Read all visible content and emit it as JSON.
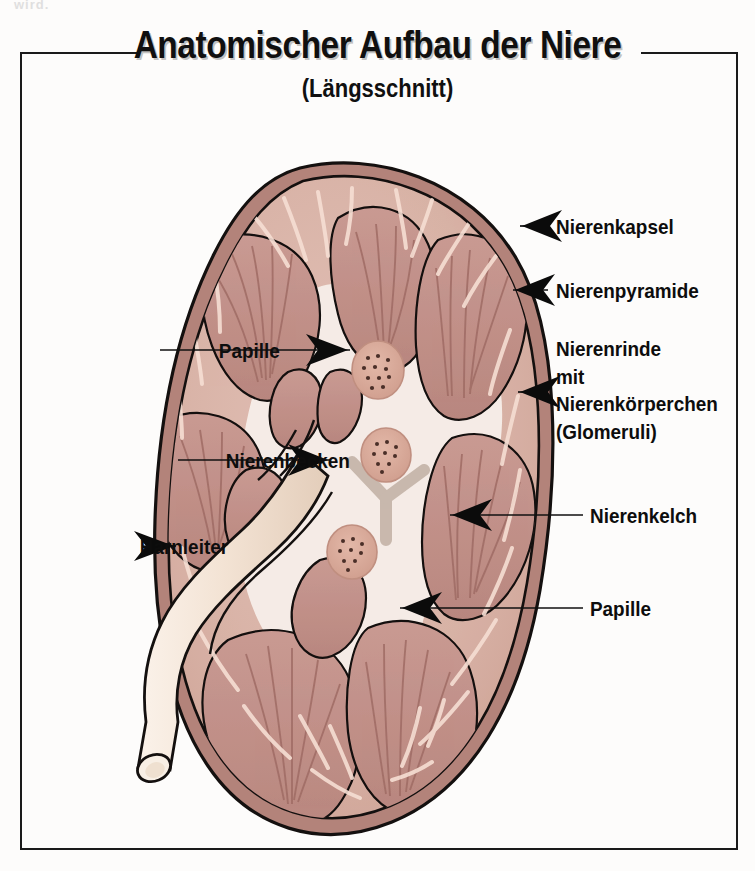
{
  "figure": {
    "title": "Anatomischer Aufbau der Niere",
    "subtitle": "(Längsschnitt)",
    "scan_fragment": "wird.",
    "organ": "Niere (Kidney), longitudinal section"
  },
  "labels": {
    "left": [
      {
        "id": "papille-top",
        "text": "Papille",
        "leader": "line"
      },
      {
        "id": "nierenbecken",
        "text": "Nierenbecken",
        "leader": "line-arrow"
      },
      {
        "id": "harnleiter",
        "text": "Harnleiter",
        "leader": "arrow"
      }
    ],
    "right": [
      {
        "id": "nierenkapsel",
        "text": "Nierenkapsel",
        "leader": "line-arrow"
      },
      {
        "id": "nierenpyramide",
        "text": "Nierenpyramide",
        "leader": "line-arrow"
      },
      {
        "id": "nierenrinde",
        "text": "Nierenrinde\nmit\nNierenkörperchen\n(Glomeruli)",
        "leader": "line-arrow"
      },
      {
        "id": "nierenkelch",
        "text": "Nierenkelch",
        "leader": "line-arrow"
      },
      {
        "id": "papille-bottom",
        "text": "Papille",
        "leader": "line-arrow"
      }
    ]
  },
  "colors": {
    "page_background": "#fdfcfb",
    "frame": "#1a1a1a",
    "capsule": "#b3837a",
    "cortex": "#d8b2a6",
    "medulla_pyramid": "#c0908a",
    "pyramid_stripe": "#a8736d",
    "pelvis": "#f6ece6",
    "ureter": "#f2e2d4",
    "papilla": "#d9a99b",
    "vessel_grey": "#b9a79a",
    "outline": "#14100f",
    "highlight": "#f7e3da",
    "text": "#0d0d0d"
  }
}
